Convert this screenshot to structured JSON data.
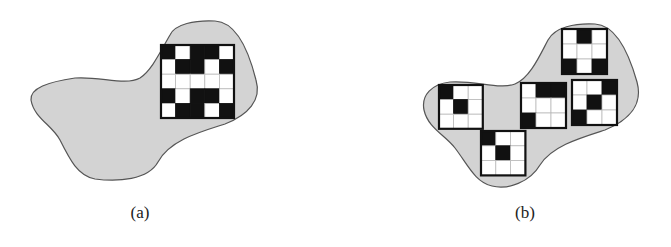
{
  "colors": {
    "region_fill": "#d3d3d3",
    "region_stroke": "#555555",
    "cell_black": "#111111",
    "cell_white": "#ffffff",
    "grid_line": "#bbbbbb",
    "grid_border": "#111111"
  },
  "panels": [
    {
      "id": "a",
      "label": "(a)",
      "label_pos": [
        140,
        203
      ],
      "region_path": "M170,35 C175,24 195,20 215,21 C235,22 248,48 256,80 C262,100 248,115 225,124 C200,132 170,140 158,162 C148,180 118,182 95,179 C78,176 70,160 60,140 C52,125 34,118 31,100 C30,88 48,82 75,78 C100,76 125,86 140,78 C152,70 160,52 170,35 Z",
      "grids": [
        {
          "x": 161,
          "y": 45,
          "cell": 14.6,
          "cells": [
            [
              1,
              0,
              1,
              1,
              0
            ],
            [
              0,
              1,
              1,
              0,
              1
            ],
            [
              0,
              0,
              0,
              0,
              0
            ],
            [
              1,
              0,
              1,
              1,
              0
            ],
            [
              0,
              1,
              1,
              0,
              1
            ]
          ]
        }
      ]
    },
    {
      "id": "b",
      "label": "(b)",
      "label_pos": [
        525,
        203
      ],
      "region_path": "M548,40 C555,27 575,23 595,24 C615,25 628,50 637,82 C643,104 630,120 605,130 C580,138 552,146 540,165 C530,182 508,190 492,186 C475,182 468,165 455,148 C445,135 428,128 424,110 C421,95 432,84 450,82 C475,80 500,90 515,84 C530,78 540,55 548,40 Z",
      "grids": [
        {
          "x": 562,
          "y": 29,
          "cell": 15,
          "cells": [
            [
              0,
              1,
              0
            ],
            [
              0,
              0,
              0
            ],
            [
              1,
              0,
              1
            ]
          ]
        },
        {
          "x": 439,
          "y": 85,
          "cell": 14.6,
          "cells": [
            [
              1,
              0,
              0
            ],
            [
              0,
              1,
              0
            ],
            [
              0,
              0,
              0
            ]
          ]
        },
        {
          "x": 521,
          "y": 83,
          "cell": 15,
          "cells": [
            [
              0,
              1,
              1
            ],
            [
              0,
              0,
              0
            ],
            [
              1,
              0,
              0
            ]
          ]
        },
        {
          "x": 572,
          "y": 80,
          "cell": 15,
          "cells": [
            [
              0,
              0,
              1
            ],
            [
              0,
              1,
              0
            ],
            [
              1,
              0,
              0
            ]
          ]
        },
        {
          "x": 481,
          "y": 131,
          "cell": 14.8,
          "cells": [
            [
              1,
              0,
              0
            ],
            [
              0,
              1,
              0
            ],
            [
              0,
              0,
              0
            ]
          ]
        }
      ]
    }
  ]
}
